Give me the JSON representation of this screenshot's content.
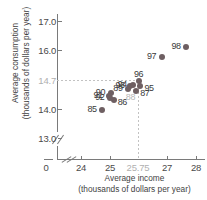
{
  "chart_data": {
    "type": "scatter",
    "title": "",
    "xlabel": "Average income (thousands of dollars per year)",
    "ylabel": "Average consumption (thousands of dollars per year)",
    "xlabel_line1": "Average income",
    "xlabel_line2": "(thousands of dollars per year)",
    "ylabel_line1": "Average consumption",
    "ylabel_line2": "(thousands of dollars per year)",
    "xlim": [
      23.6,
      28.4
    ],
    "ylim": [
      12.7,
      17.2
    ],
    "x_ticks": [
      "0",
      "24",
      "25",
      "25.75",
      "27",
      "28"
    ],
    "y_ticks": [
      "17.0",
      "16.0",
      "14.7",
      "14.0",
      "13.0"
    ],
    "x_reference": "25.75",
    "y_reference": "14.7",
    "grid": false,
    "legend": "none",
    "axis_break_x": true,
    "axis_break_y": true,
    "point_color": "#6e5f62",
    "reference_color": "#b7b7b7",
    "axis_color": "#7a7a7a",
    "points": [
      {
        "label": "85",
        "x": 24.73,
        "y": 13.97,
        "label_pos": "left",
        "muted": false
      },
      {
        "label": "86",
        "x": 25.12,
        "y": 14.3,
        "label_pos": "right",
        "muted": false
      },
      {
        "label": "87",
        "x": 25.9,
        "y": 14.62,
        "label_pos": "right",
        "muted": false
      },
      {
        "label": "88",
        "x": 25.75,
        "y": 14.7,
        "label_pos": "below",
        "muted": true
      },
      {
        "label": "89",
        "x": 25.63,
        "y": 14.7,
        "label_pos": "left",
        "muted": false
      },
      {
        "label": "90",
        "x": 25.02,
        "y": 14.55,
        "label_pos": "left",
        "muted": false
      },
      {
        "label": "91",
        "x": 24.94,
        "y": 14.47,
        "label_pos": "left",
        "muted": false
      },
      {
        "label": "92",
        "x": 25.0,
        "y": 14.38,
        "label_pos": "left",
        "muted": false
      },
      {
        "label": "93",
        "x": 25.7,
        "y": 14.8,
        "label_pos": "left",
        "muted": false
      },
      {
        "label": "94",
        "x": 25.78,
        "y": 14.82,
        "label_pos": "left",
        "muted": false
      },
      {
        "label": "95",
        "x": 26.05,
        "y": 14.8,
        "label_pos": "right",
        "muted": false
      },
      {
        "label": "96",
        "x": 26.0,
        "y": 14.95,
        "label_pos": "above",
        "muted": false
      },
      {
        "label": "97",
        "x": 26.8,
        "y": 15.8,
        "label_pos": "left",
        "muted": false
      },
      {
        "label": "98",
        "x": 27.65,
        "y": 16.12,
        "label_pos": "left",
        "muted": false
      }
    ]
  }
}
